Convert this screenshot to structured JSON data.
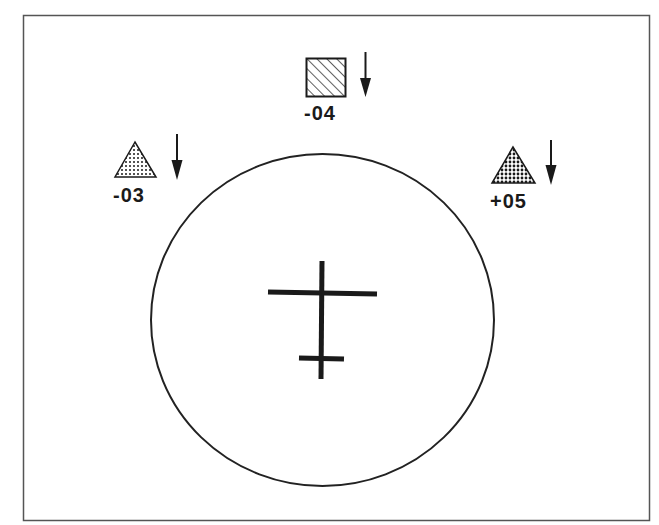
{
  "diagram": {
    "type": "radar-display",
    "frame": {
      "stroke": "#555555"
    },
    "scope_circle": {
      "stroke": "#222222"
    },
    "own_aircraft_symbol": {
      "color": "#1a1a1a"
    },
    "targets": [
      {
        "id": "target-left",
        "shape": "triangle",
        "fill": "dotted-light",
        "label": "-03",
        "trend": "descending"
      },
      {
        "id": "target-top",
        "shape": "square",
        "fill": "hatched",
        "label": "-04",
        "trend": "descending"
      },
      {
        "id": "target-right",
        "shape": "triangle",
        "fill": "dotted-dense",
        "label": "+05",
        "trend": "descending"
      }
    ]
  }
}
